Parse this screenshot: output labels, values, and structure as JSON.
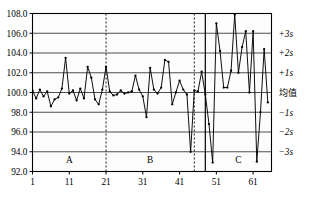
{
  "chart_data": {
    "type": "line",
    "title": "",
    "xlabel": "",
    "ylabel": "",
    "grid": true,
    "legend_position": "none",
    "ylim": [
      92.0,
      108.0
    ],
    "xlim": [
      1,
      66
    ],
    "y_ticks": [
      "108.0",
      "106.0",
      "104.0",
      "102.0",
      "100.0",
      "98.0",
      "96.0",
      "94.0",
      "92.0"
    ],
    "y_tick_values": [
      108.0,
      106.0,
      104.0,
      102.0,
      100.0,
      98.0,
      96.0,
      94.0,
      92.0
    ],
    "x_ticks": [
      "1",
      "11",
      "21",
      "31",
      "41",
      "51",
      "61"
    ],
    "x_tick_values": [
      1,
      11,
      21,
      31,
      41,
      51,
      61
    ],
    "right_axis_labels": [
      {
        "text": "+3s",
        "value": 106.0
      },
      {
        "text": "+2s",
        "value": 104.0
      },
      {
        "text": "+1s",
        "value": 102.0
      },
      {
        "text": "均值",
        "value": 100.0
      },
      {
        "text": "−1s",
        "value": 98.0
      },
      {
        "text": "−2s",
        "value": 96.0
      },
      {
        "text": "−3s",
        "value": 94.0
      }
    ],
    "zones": [
      {
        "label": "A",
        "start": 1,
        "end": 21
      },
      {
        "label": "B",
        "start": 21,
        "end": 45
      },
      {
        "label": "C",
        "start": 48,
        "end": 66
      }
    ],
    "dividers": [
      {
        "x": 21,
        "style": "dashed"
      },
      {
        "x": 45,
        "style": "dashed"
      },
      {
        "x": 48,
        "style": "solid"
      }
    ],
    "series": [
      {
        "name": "measurement",
        "marker": "dot",
        "color": "#000000",
        "x": [
          1,
          2,
          3,
          4,
          5,
          6,
          7,
          8,
          9,
          10,
          11,
          12,
          13,
          14,
          15,
          16,
          17,
          18,
          19,
          20,
          21,
          22,
          23,
          24,
          25,
          26,
          27,
          28,
          29,
          30,
          31,
          32,
          33,
          34,
          35,
          36,
          37,
          38,
          39,
          40,
          41,
          42,
          43,
          44,
          45,
          46,
          47,
          48,
          49,
          50,
          51,
          52,
          53,
          54,
          55,
          56,
          57,
          58,
          59,
          60,
          61,
          62,
          63,
          64,
          65
        ],
        "values": [
          100.2,
          99.4,
          100.3,
          99.6,
          100.1,
          98.6,
          99.3,
          99.5,
          100.4,
          103.5,
          99.9,
          100.2,
          99.2,
          100.4,
          99.4,
          102.6,
          101.5,
          99.3,
          98.8,
          100.3,
          102.6,
          100.1,
          99.7,
          99.8,
          100.2,
          99.9,
          100.0,
          100.1,
          101.7,
          100.3,
          99.6,
          97.5,
          102.5,
          100.3,
          99.9,
          100.5,
          103.3,
          103.1,
          98.8,
          100.0,
          101.2,
          100.3,
          99.8,
          94.0,
          100.2,
          100.1,
          102.1,
          99.8,
          96.8,
          92.9,
          107.0,
          104.2,
          100.5,
          100.5,
          102.2,
          107.9,
          102.0,
          104.6,
          106.2,
          100.0,
          106.2,
          93.0,
          98.0,
          104.4,
          99.0
        ]
      }
    ]
  },
  "axes": {
    "y_axis_name": "value-axis",
    "x_axis_name": "sample-index-axis"
  }
}
